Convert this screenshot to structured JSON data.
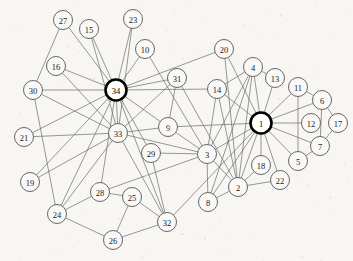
{
  "figure": {
    "background_color": "#f7f6f3",
    "node_fill": "#faf9f7",
    "node_stroke": "#555555",
    "hub_stroke": "#000000",
    "edge_color": "#6b6b6b",
    "width": 353,
    "height": 261
  },
  "chart_data": {
    "type": "diagram",
    "graph_type": "undirected-network",
    "node_count": 34,
    "edge_count": 78,
    "highlighted_nodes": [
      "1",
      "34"
    ],
    "nodes": [
      {
        "id": "1",
        "label": "1",
        "x": 261,
        "y": 123,
        "r": 10.5,
        "hub": true
      },
      {
        "id": "2",
        "label": "2",
        "x": 238,
        "y": 187,
        "r": 9.5,
        "hub": false
      },
      {
        "id": "3",
        "label": "3",
        "x": 207,
        "y": 154,
        "r": 9.5,
        "hub": false
      },
      {
        "id": "4",
        "label": "4",
        "x": 253,
        "y": 67,
        "r": 9.5,
        "hub": false
      },
      {
        "id": "5",
        "label": "5",
        "x": 298,
        "y": 161,
        "r": 9.5,
        "hub": false
      },
      {
        "id": "6",
        "label": "6",
        "x": 322,
        "y": 100,
        "r": 9.5,
        "hub": false
      },
      {
        "id": "7",
        "label": "7",
        "x": 320,
        "y": 146,
        "r": 9.5,
        "hub": false
      },
      {
        "id": "8",
        "label": "8",
        "x": 208,
        "y": 202,
        "r": 9.5,
        "hub": false
      },
      {
        "id": "9",
        "label": "9",
        "x": 168,
        "y": 127,
        "r": 9.5,
        "hub": false
      },
      {
        "id": "10",
        "label": "10",
        "x": 145,
        "y": 49,
        "r": 9.5,
        "hub": false
      },
      {
        "id": "11",
        "label": "11",
        "x": 298,
        "y": 87,
        "r": 9.5,
        "hub": false
      },
      {
        "id": "12",
        "label": "12",
        "x": 311,
        "y": 123,
        "r": 9.5,
        "hub": false
      },
      {
        "id": "13",
        "label": "13",
        "x": 275,
        "y": 78,
        "r": 9.5,
        "hub": false
      },
      {
        "id": "14",
        "label": "14",
        "x": 217,
        "y": 89,
        "r": 9.5,
        "hub": false
      },
      {
        "id": "15",
        "label": "15",
        "x": 89,
        "y": 29,
        "r": 9.5,
        "hub": false
      },
      {
        "id": "16",
        "label": "16",
        "x": 56,
        "y": 66,
        "r": 9.5,
        "hub": false
      },
      {
        "id": "17",
        "label": "17",
        "x": 338,
        "y": 123,
        "r": 9.5,
        "hub": false
      },
      {
        "id": "18",
        "label": "18",
        "x": 261,
        "y": 165,
        "r": 9.5,
        "hub": false
      },
      {
        "id": "19",
        "label": "19",
        "x": 30,
        "y": 182,
        "r": 9.5,
        "hub": false
      },
      {
        "id": "20",
        "label": "20",
        "x": 224,
        "y": 49,
        "r": 9.5,
        "hub": false
      },
      {
        "id": "21",
        "label": "21",
        "x": 24,
        "y": 137,
        "r": 9.5,
        "hub": false
      },
      {
        "id": "22",
        "label": "22",
        "x": 280,
        "y": 180,
        "r": 9.5,
        "hub": false
      },
      {
        "id": "23",
        "label": "23",
        "x": 133,
        "y": 19,
        "r": 9.5,
        "hub": false
      },
      {
        "id": "24",
        "label": "24",
        "x": 57,
        "y": 214,
        "r": 9.5,
        "hub": false
      },
      {
        "id": "25",
        "label": "25",
        "x": 132,
        "y": 197,
        "r": 9.5,
        "hub": false
      },
      {
        "id": "26",
        "label": "26",
        "x": 113,
        "y": 240,
        "r": 9.5,
        "hub": false
      },
      {
        "id": "27",
        "label": "27",
        "x": 63,
        "y": 20,
        "r": 9.5,
        "hub": false
      },
      {
        "id": "28",
        "label": "28",
        "x": 100,
        "y": 192,
        "r": 9.5,
        "hub": false
      },
      {
        "id": "29",
        "label": "29",
        "x": 151,
        "y": 153,
        "r": 9.5,
        "hub": false
      },
      {
        "id": "30",
        "label": "30",
        "x": 33,
        "y": 90,
        "r": 9.5,
        "hub": false
      },
      {
        "id": "31",
        "label": "31",
        "x": 177,
        "y": 78,
        "r": 9.5,
        "hub": false
      },
      {
        "id": "32",
        "label": "32",
        "x": 167,
        "y": 222,
        "r": 9.5,
        "hub": false
      },
      {
        "id": "33",
        "label": "33",
        "x": 118,
        "y": 133,
        "r": 9.5,
        "hub": false
      },
      {
        "id": "34",
        "label": "34",
        "x": 116,
        "y": 90,
        "r": 10.5,
        "hub": true
      }
    ],
    "edges": [
      [
        "1",
        "2"
      ],
      [
        "1",
        "3"
      ],
      [
        "1",
        "4"
      ],
      [
        "1",
        "5"
      ],
      [
        "1",
        "6"
      ],
      [
        "1",
        "7"
      ],
      [
        "1",
        "8"
      ],
      [
        "1",
        "9"
      ],
      [
        "1",
        "11"
      ],
      [
        "1",
        "12"
      ],
      [
        "1",
        "13"
      ],
      [
        "1",
        "14"
      ],
      [
        "1",
        "18"
      ],
      [
        "1",
        "20"
      ],
      [
        "1",
        "22"
      ],
      [
        "1",
        "32"
      ],
      [
        "2",
        "3"
      ],
      [
        "2",
        "4"
      ],
      [
        "2",
        "8"
      ],
      [
        "2",
        "14"
      ],
      [
        "2",
        "18"
      ],
      [
        "2",
        "20"
      ],
      [
        "2",
        "22"
      ],
      [
        "2",
        "31"
      ],
      [
        "3",
        "4"
      ],
      [
        "3",
        "8"
      ],
      [
        "3",
        "9"
      ],
      [
        "3",
        "10"
      ],
      [
        "3",
        "14"
      ],
      [
        "3",
        "28"
      ],
      [
        "3",
        "29"
      ],
      [
        "3",
        "33"
      ],
      [
        "4",
        "8"
      ],
      [
        "4",
        "13"
      ],
      [
        "4",
        "14"
      ],
      [
        "5",
        "7"
      ],
      [
        "5",
        "11"
      ],
      [
        "6",
        "7"
      ],
      [
        "6",
        "11"
      ],
      [
        "6",
        "17"
      ],
      [
        "7",
        "17"
      ],
      [
        "9",
        "31"
      ],
      [
        "9",
        "33"
      ],
      [
        "9",
        "34"
      ],
      [
        "10",
        "34"
      ],
      [
        "14",
        "34"
      ],
      [
        "15",
        "33"
      ],
      [
        "15",
        "34"
      ],
      [
        "16",
        "33"
      ],
      [
        "16",
        "34"
      ],
      [
        "19",
        "33"
      ],
      [
        "19",
        "34"
      ],
      [
        "20",
        "34"
      ],
      [
        "21",
        "33"
      ],
      [
        "21",
        "34"
      ],
      [
        "23",
        "33"
      ],
      [
        "23",
        "34"
      ],
      [
        "24",
        "26"
      ],
      [
        "24",
        "28"
      ],
      [
        "24",
        "30"
      ],
      [
        "24",
        "33"
      ],
      [
        "24",
        "34"
      ],
      [
        "25",
        "26"
      ],
      [
        "25",
        "28"
      ],
      [
        "25",
        "32"
      ],
      [
        "26",
        "32"
      ],
      [
        "27",
        "30"
      ],
      [
        "27",
        "34"
      ],
      [
        "28",
        "34"
      ],
      [
        "29",
        "32"
      ],
      [
        "29",
        "34"
      ],
      [
        "30",
        "33"
      ],
      [
        "30",
        "34"
      ],
      [
        "31",
        "33"
      ],
      [
        "31",
        "34"
      ],
      [
        "32",
        "33"
      ],
      [
        "32",
        "34"
      ],
      [
        "33",
        "34"
      ]
    ]
  }
}
